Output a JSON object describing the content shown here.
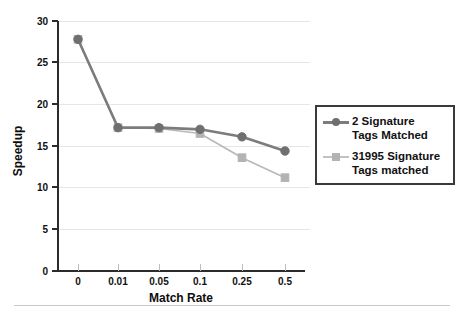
{
  "chart_data": {
    "type": "line",
    "title": "",
    "xlabel": "Match Rate",
    "ylabel": "Speedup",
    "categories": [
      "0",
      "0.01",
      "0.05",
      "0.1",
      "0.25",
      "0.5"
    ],
    "ylim": [
      0,
      30
    ],
    "yticks": [
      0,
      5,
      10,
      15,
      20,
      25,
      30
    ],
    "grid": true,
    "legend_position": "right",
    "series": [
      {
        "name": "2 Signature Tags Matched",
        "marker": "circle",
        "color": "#6f6f6f",
        "line_color": "#7c7c7c",
        "values": [
          27.8,
          17.2,
          17.2,
          17.0,
          16.1,
          14.4
        ]
      },
      {
        "name": "31995 Signature Tags matched",
        "marker": "square",
        "color": "#b3b3b3",
        "line_color": "#b9b9b9",
        "values": [
          27.8,
          17.2,
          17.1,
          16.5,
          13.6,
          11.2
        ]
      }
    ]
  },
  "legend": {
    "entries": [
      {
        "label": "2 Signature\nTags Matched",
        "marker": "circle-marker-icon"
      },
      {
        "label": "31995 Signature\nTags matched",
        "marker": "square-marker-icon"
      }
    ]
  },
  "caption": {
    "text": ""
  }
}
